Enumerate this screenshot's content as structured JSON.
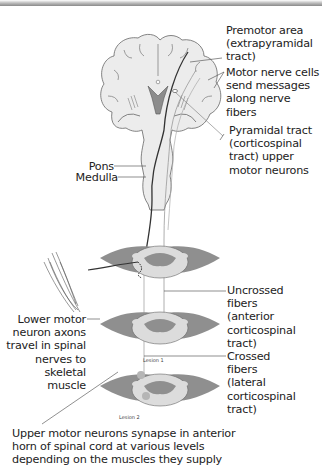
{
  "figure": {
    "labels": {
      "premotor": "Premotor area\n(extrapyramidal\ntract)",
      "motor_cells": "Motor nerve cells\nsend messages\nalong nerve\nfibers",
      "pyramidal": "Pyramidal tract\n(corticospinal\ntract) upper\nmotor neurons",
      "pons": "Pons",
      "medulla": "Medulla",
      "uncrossed": "Uncrossed\nfibers\n(anterior\ncorticospinal\ntract)",
      "crossed": "Crossed\nfibers\n(lateral\ncorticospinal\ntract)",
      "lower_motor": "Lower motor\nneuron axons\ntravel in spinal\nnerves to\nskeletal muscle",
      "lesion1": "Lesion 1",
      "lesion2": "Lesion 2",
      "caption": "Upper motor neurons synapse in anterior\nhorn of spinal cord at various levels\ndepending on the muscles they supply"
    },
    "colors": {
      "brain_fill": "#ececec",
      "gray_matter": "#8f8f8f",
      "white_matter": "#dcdcdc",
      "outline": "#555555",
      "tract": "#333333"
    }
  }
}
